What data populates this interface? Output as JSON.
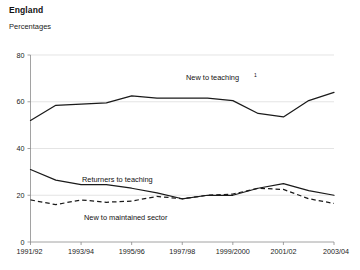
{
  "header": {
    "title": "England",
    "subtitle": "Percentages"
  },
  "chart_data": {
    "type": "line",
    "title": "England",
    "subtitle": "Percentages",
    "xlabel": "",
    "ylabel": "Percentages",
    "ylim": [
      0,
      80
    ],
    "yticks": [
      0,
      20,
      40,
      60,
      80
    ],
    "grid": true,
    "legend_position": "inline-annotations",
    "x": [
      "1991/92",
      "1992/93",
      "1993/94",
      "1994/95",
      "1995/96",
      "1996/97",
      "1997/98",
      "1998/99",
      "1999/2000",
      "2000/01",
      "2001/02",
      "2002/03",
      "2003/04"
    ],
    "xtick_labels": [
      "1991/92",
      "1993/94",
      "1995/96",
      "1997/98",
      "1999/2000",
      "2001/02",
      "2003/04"
    ],
    "series": [
      {
        "name": "New to teaching",
        "label": "New to teaching",
        "footnote_marker": "1",
        "style": "solid",
        "color": "#1a1a1a",
        "values": [
          52,
          58.5,
          59,
          59.5,
          62.5,
          61.5,
          61.5,
          61.5,
          60.5,
          55,
          53.5,
          60.5,
          64
        ]
      },
      {
        "name": "Returners to teaching",
        "label": "Returners to teaching",
        "footnote_marker": "",
        "style": "solid",
        "color": "#1a1a1a",
        "values": [
          31,
          26.5,
          24.5,
          24.5,
          23,
          21,
          18.5,
          20,
          20,
          23,
          25,
          22,
          20
        ]
      },
      {
        "name": "New to maintained sector",
        "label": "New to maintained sector",
        "footnote_marker": "",
        "style": "dashed",
        "color": "#1a1a1a",
        "values": [
          18,
          16,
          18,
          17,
          17.5,
          19.5,
          18.5,
          20,
          20.5,
          23,
          22.5,
          18.5,
          16.5
        ]
      }
    ]
  },
  "annotations": {
    "new_to_teaching": {
      "label": "New to teaching",
      "sup": "1",
      "x": 186,
      "y": 80
    },
    "returners": {
      "label": "Returners to teaching",
      "x": 82,
      "y": 182
    },
    "maintained": {
      "label": "New to maintained sector",
      "x": 84,
      "y": 220
    }
  }
}
